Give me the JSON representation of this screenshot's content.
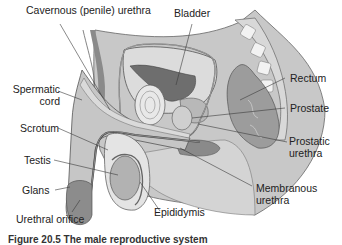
{
  "figure": {
    "labels": {
      "cavernous_urethra": "Cavernous (penile) urethra",
      "bladder": "Bladder",
      "rectum": "Rectum",
      "prostate": "Prostate",
      "prostatic_urethra": [
        "Prostatic",
        "urethra"
      ],
      "membranous_urethra": [
        "Membranous",
        "urethra"
      ],
      "spermatic_cord": [
        "Spermatic",
        "cord"
      ],
      "scrotum": "Scrotum",
      "testis": "Testis",
      "glans": "Glans",
      "urethral_orifice": "Urethral orifice",
      "epididymis": "Epididymis"
    },
    "caption": "Figure 20.5 The male reproductive system",
    "colors": {
      "body_light": "#e2e2e2",
      "body_mid": "#c4c4c4",
      "organ_dark": "#7d7d7d",
      "organ_mid": "#a3a3a3",
      "outline": "#555555",
      "leader": "#3a3a3a"
    }
  }
}
